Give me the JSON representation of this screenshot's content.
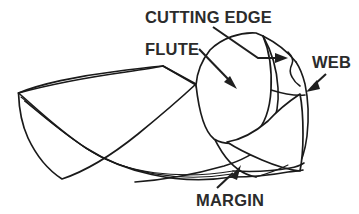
{
  "diagram": {
    "background_color": "#ffffff",
    "line_color": "#1a1a1a",
    "text_color": "#2b2b2b",
    "labels": [
      {
        "id": "cutting-edge",
        "text": "CUTTING EDGE",
        "x": 145,
        "y": 23,
        "leader": "from label down-right to the cutting lip, ending in a right-pointing arrow"
      },
      {
        "id": "flute",
        "text": "FLUTE",
        "x": 145,
        "y": 55,
        "leader": "from label down-right into the flute face, ending in a down-right arrow"
      },
      {
        "id": "web",
        "text": "WEB",
        "x": 312,
        "y": 68,
        "leader": "from label down-left to the web notch, ending in a down-left arrow"
      },
      {
        "id": "margin",
        "text": "MARGIN",
        "x": 196,
        "y": 206,
        "leader": "from label up-right to the margin land, ending in an up-right arrow"
      }
    ]
  }
}
